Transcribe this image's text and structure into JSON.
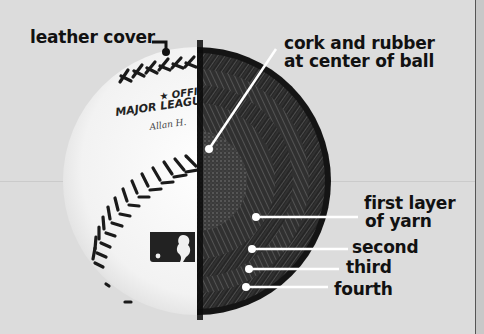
{
  "diagram": {
    "labels": {
      "leather_cover": "leather cover",
      "cork_line1": "cork and rubber",
      "cork_line2": "at center of ball",
      "first_line1": "first layer",
      "first_line2": "of yarn",
      "second": "second",
      "third": "third",
      "fourth": "fourth"
    },
    "ball_print": {
      "official": "★ OFFIC",
      "league": "MAJOR LEAGUE",
      "signature": "Allan H."
    },
    "colors": {
      "background": "#dcdcdc",
      "ball_white": "#f4f4f4",
      "stitch": "#1a1a1a",
      "interior_dark": "#1c1c1c",
      "leader_line": "#ffffff",
      "label_text": "#111111"
    }
  }
}
